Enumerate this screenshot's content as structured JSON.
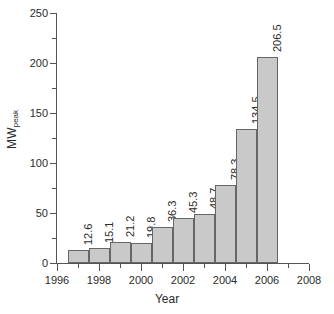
{
  "chart_data": {
    "type": "bar",
    "title": "",
    "subtitle": "",
    "xlabel": "Year",
    "ylabel": "MW",
    "ylabel_subscript": "peak",
    "ylabel_full": "MWpeak",
    "xlim": [
      1996,
      2008
    ],
    "ylim": [
      0,
      250
    ],
    "grid": false,
    "legend": null,
    "legend_position": "none",
    "bar_fill_color": "#c9c9c9",
    "bar_edge_color": "#666666",
    "axis_color": "#555555",
    "text_color": "#2b2b2b",
    "x_major_ticks": [
      1996,
      1998,
      2000,
      2002,
      2004,
      2006,
      2008
    ],
    "x_minor_ticks": [
      1997,
      1999,
      2001,
      2003,
      2005,
      2007
    ],
    "x_tick_labels": [
      "1996",
      "1998",
      "2000",
      "2002",
      "2004",
      "2006",
      "2008"
    ],
    "y_major_ticks": [
      0,
      50,
      100,
      150,
      200,
      250
    ],
    "y_minor_ticks": [
      25,
      75,
      125,
      175,
      225
    ],
    "y_tick_labels": [
      "0",
      "50",
      "100",
      "150",
      "200",
      "250"
    ],
    "categories": [
      "1996",
      "1997",
      "1998",
      "1999",
      "2000",
      "2001",
      "2002",
      "2003",
      "2004",
      "2005"
    ],
    "values": [
      12.6,
      15.1,
      21.2,
      19.8,
      36.3,
      45.3,
      48.7,
      78.3,
      134.5,
      206.5
    ],
    "data_labels": [
      "12.6",
      "15.1",
      "21.2",
      "19.8",
      "36.3",
      "45.3",
      "48.7",
      "78.3",
      "134.5",
      "206.5"
    ],
    "data_label_rotation": 90,
    "bar_start_x": [
      1996.5,
      1997.5,
      1998.5,
      1999.5,
      2000.5,
      2001.5,
      2002.5,
      2003.5,
      2004.5,
      2005.5
    ],
    "bar_width_years": 1,
    "bars": [
      {
        "x": 1996.5,
        "category": "1996",
        "value": 12.6,
        "label": "12.6"
      },
      {
        "x": 1997.5,
        "category": "1997",
        "value": 15.1,
        "label": "15.1"
      },
      {
        "x": 1998.5,
        "category": "1998",
        "value": 21.2,
        "label": "21.2"
      },
      {
        "x": 1999.5,
        "category": "1999",
        "value": 19.8,
        "label": "19.8"
      },
      {
        "x": 2000.5,
        "category": "2000",
        "value": 36.3,
        "label": "36.3"
      },
      {
        "x": 2001.5,
        "category": "2001",
        "value": 45.3,
        "label": "45.3"
      },
      {
        "x": 2002.5,
        "category": "2002",
        "value": 48.7,
        "label": "48.7"
      },
      {
        "x": 2003.5,
        "category": "2003",
        "value": 78.3,
        "label": "78.3"
      },
      {
        "x": 2004.5,
        "category": "2004",
        "value": 134.5,
        "label": "134.5"
      },
      {
        "x": 2005.5,
        "category": "2005",
        "value": 206.5,
        "label": "206.5"
      }
    ]
  }
}
